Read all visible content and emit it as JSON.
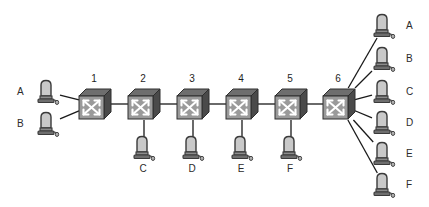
{
  "diagram": {
    "type": "network-topology",
    "width": 429,
    "height": 207,
    "background": "#ffffff",
    "link_color": "#1a1a1a",
    "switch_face_color": "#9a9a9a",
    "switch_top_color": "#6e6e6e",
    "switch_side_color": "#4a4a4a",
    "switch_arrow_color": "#ffffff",
    "host_color": "#8c8c8c",
    "host_outline_color": "#3a3a3a",
    "label_color": "#2b2b2b"
  },
  "switches": [
    {
      "id": "sw1",
      "label": "1",
      "x": 95,
      "y": 104
    },
    {
      "id": "sw2",
      "label": "2",
      "x": 144,
      "y": 104
    },
    {
      "id": "sw3",
      "label": "3",
      "x": 193,
      "y": 104
    },
    {
      "id": "sw4",
      "label": "4",
      "x": 242,
      "y": 104
    },
    {
      "id": "sw5",
      "label": "5",
      "x": 291,
      "y": 104
    },
    {
      "id": "sw6",
      "label": "6",
      "x": 339,
      "y": 104
    }
  ],
  "hosts_left": [
    {
      "id": "hl-a",
      "label": "A",
      "x": 48,
      "y": 92
    },
    {
      "id": "hl-b",
      "label": "B",
      "x": 48,
      "y": 124
    }
  ],
  "hosts_bottom": [
    {
      "id": "hb-c",
      "label": "C",
      "x": 144,
      "y": 148
    },
    {
      "id": "hb-d",
      "label": "D",
      "x": 193,
      "y": 148
    },
    {
      "id": "hb-e",
      "label": "E",
      "x": 242,
      "y": 148
    },
    {
      "id": "hb-f",
      "label": "F",
      "x": 291,
      "y": 148
    }
  ],
  "hosts_right": [
    {
      "id": "hr-a",
      "label": "A",
      "x": 384,
      "y": 26
    },
    {
      "id": "hr-b",
      "label": "B",
      "x": 384,
      "y": 59
    },
    {
      "id": "hr-c",
      "label": "C",
      "x": 384,
      "y": 92
    },
    {
      "id": "hr-d",
      "label": "D",
      "x": 384,
      "y": 123
    },
    {
      "id": "hr-e",
      "label": "E",
      "x": 384,
      "y": 154
    },
    {
      "id": "hr-f",
      "label": "F",
      "x": 384,
      "y": 185
    }
  ],
  "links": [
    {
      "from": "hl-a",
      "to": "sw1"
    },
    {
      "from": "hl-b",
      "to": "sw1"
    },
    {
      "from": "sw1",
      "to": "sw2"
    },
    {
      "from": "sw2",
      "to": "sw3"
    },
    {
      "from": "sw3",
      "to": "sw4"
    },
    {
      "from": "sw4",
      "to": "sw5"
    },
    {
      "from": "sw5",
      "to": "sw6"
    },
    {
      "from": "sw2",
      "to": "hb-c"
    },
    {
      "from": "sw3",
      "to": "hb-d"
    },
    {
      "from": "sw4",
      "to": "hb-e"
    },
    {
      "from": "sw5",
      "to": "hb-f"
    },
    {
      "from": "sw6",
      "to": "hr-a"
    },
    {
      "from": "sw6",
      "to": "hr-b"
    },
    {
      "from": "sw6",
      "to": "hr-c"
    },
    {
      "from": "sw6",
      "to": "hr-d"
    },
    {
      "from": "sw6",
      "to": "hr-e"
    },
    {
      "from": "sw6",
      "to": "hr-f"
    }
  ]
}
